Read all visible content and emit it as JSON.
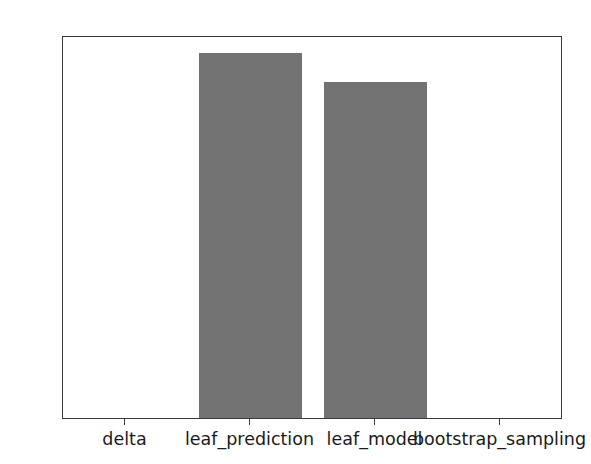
{
  "chart_data": {
    "type": "bar",
    "title": "",
    "xlabel": "",
    "ylabel": "",
    "categories": [
      "delta",
      "leaf_prediction",
      "leaf_model",
      "bootstrap_sampling"
    ],
    "values": [
      0,
      100,
      92,
      0
    ],
    "series": [
      {
        "name": "count",
        "values": [
          0,
          100,
          92,
          0
        ]
      }
    ],
    "ylim": [
      0,
      105
    ],
    "yticks": [
      0,
      20,
      40,
      60,
      80,
      100
    ],
    "ytick_labels": [
      "0",
      "20",
      "40",
      "60",
      "80",
      "100"
    ],
    "xtick_labels": [
      "delta",
      "leaf_prediction",
      "leaf_model",
      "bootstrap_sampling"
    ],
    "grid": false,
    "legend": false,
    "legend_position": "none",
    "bar_color": "#727272",
    "axis_color": "#3a3a3a",
    "background_color": "#ffffff",
    "bar_width_fraction": 0.82
  }
}
